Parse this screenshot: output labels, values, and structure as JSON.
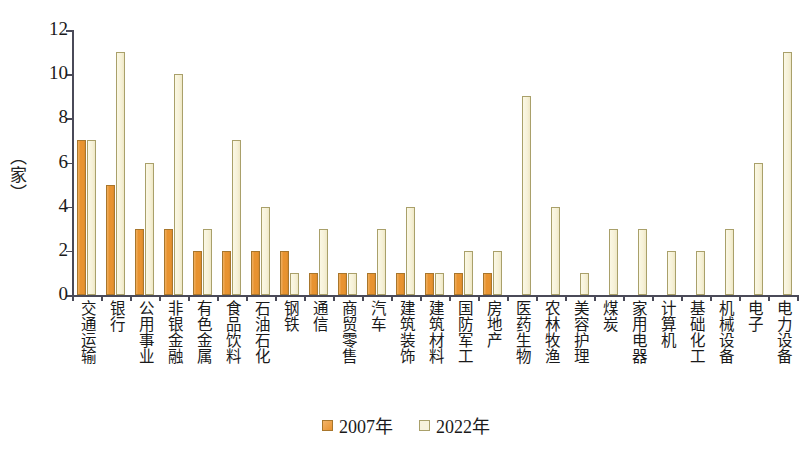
{
  "chart_data": {
    "type": "bar",
    "title": "",
    "xlabel": "",
    "ylabel": "（家）",
    "ylim": [
      0,
      12
    ],
    "ytick_values": [
      0,
      2,
      4,
      6,
      8,
      10,
      12
    ],
    "ytick_labels": [
      "0",
      "2",
      "4",
      "6",
      "8",
      "10",
      "12"
    ],
    "grid": false,
    "legend_position": "bottom-center",
    "categories": [
      "交通运输",
      "银行",
      "公用事业",
      "非银金融",
      "有色金属",
      "食品饮料",
      "石油石化",
      "钢铁",
      "通信",
      "商贸零售",
      "汽车",
      "建筑装饰",
      "建筑材料",
      "国防军工",
      "房地产",
      "医药生物",
      "农林牧渔",
      "美容护理",
      "煤炭",
      "家用电器",
      "计算机",
      "基础化工",
      "机械设备",
      "电子",
      "电力设备"
    ],
    "series": [
      {
        "name": "2007年",
        "color": "#e89330",
        "values": [
          7,
          5,
          3,
          3,
          2,
          2,
          2,
          2,
          1,
          1,
          1,
          1,
          1,
          1,
          1,
          0,
          0,
          0,
          0,
          0,
          0,
          0,
          0,
          0,
          0
        ]
      },
      {
        "name": "2022年",
        "color": "#f7f2dc",
        "values": [
          7,
          11,
          6,
          10,
          3,
          7,
          4,
          1,
          3,
          1,
          3,
          4,
          1,
          2,
          2,
          9,
          4,
          1,
          3,
          3,
          2,
          2,
          3,
          6,
          11
        ]
      }
    ]
  },
  "legend": {
    "items": [
      {
        "label": "2007年",
        "swatch": "s2007"
      },
      {
        "label": "2022年",
        "swatch": "s2022"
      }
    ]
  }
}
